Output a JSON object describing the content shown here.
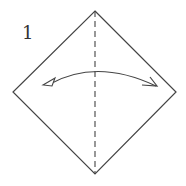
{
  "diagram": {
    "type": "origami-step",
    "step_number": "1",
    "elements": [
      {
        "kind": "square-paper",
        "orientation": "diamond"
      },
      {
        "kind": "valley-fold-line",
        "direction": "vertical",
        "style": "dashed"
      },
      {
        "kind": "fold-and-unfold-arrow",
        "direction": "left-right"
      }
    ],
    "colors": {
      "line": "#444444",
      "paper": "#ffffff"
    }
  }
}
